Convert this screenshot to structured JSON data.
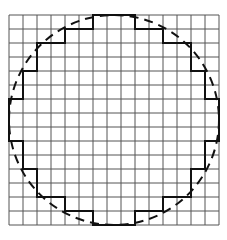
{
  "diagram": {
    "grid": {
      "cols": 15,
      "rows": 15,
      "cell_size_px": 14,
      "origin_px": [
        9,
        15
      ],
      "line_color": "#555555"
    },
    "circle": {
      "center_cells": [
        7.5,
        7.5
      ],
      "radius_cells": 7.5,
      "style": "dashed",
      "color": "#111111"
    },
    "staircase": {
      "style": "solid",
      "color": "#111111",
      "points_cells": [
        [
          6,
          0
        ],
        [
          9,
          0
        ],
        [
          9,
          1
        ],
        [
          11,
          1
        ],
        [
          11,
          2
        ],
        [
          13,
          2
        ],
        [
          13,
          4
        ],
        [
          14,
          4
        ],
        [
          14,
          6
        ],
        [
          15,
          6
        ],
        [
          15,
          9
        ],
        [
          14,
          9
        ],
        [
          14,
          11
        ],
        [
          13,
          11
        ],
        [
          13,
          13
        ],
        [
          11,
          13
        ],
        [
          11,
          14
        ],
        [
          9,
          14
        ],
        [
          9,
          15
        ],
        [
          6,
          15
        ],
        [
          6,
          14
        ],
        [
          4,
          14
        ],
        [
          4,
          13
        ],
        [
          2,
          13
        ],
        [
          2,
          11
        ],
        [
          1,
          11
        ],
        [
          1,
          9
        ],
        [
          0,
          9
        ],
        [
          0,
          6
        ],
        [
          1,
          6
        ],
        [
          1,
          4
        ],
        [
          2,
          4
        ],
        [
          2,
          2
        ],
        [
          4,
          2
        ],
        [
          4,
          1
        ],
        [
          6,
          1
        ],
        [
          6,
          0
        ]
      ]
    }
  }
}
